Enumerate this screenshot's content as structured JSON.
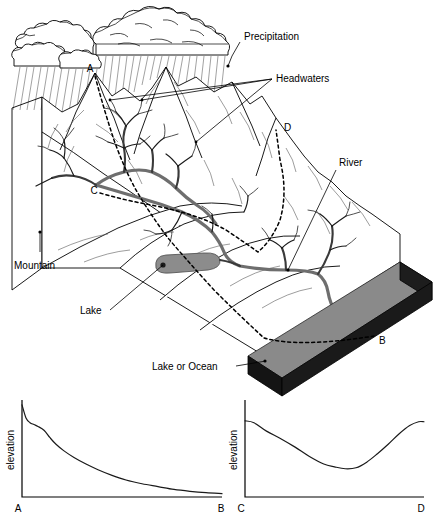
{
  "labels": {
    "precipitation": "Precipitation",
    "headwaters": "Headwaters",
    "river": "River",
    "mountain": "Mountain",
    "lake": "Lake",
    "lake_or_ocean": "Lake or Ocean"
  },
  "points": {
    "a": "A",
    "b": "B",
    "c": "C",
    "d": "D"
  },
  "colors": {
    "ocean_top": "#8a8a8a",
    "ocean_side": "#141414",
    "ocean_front": "#1d1d1d",
    "lake_fill": "#8c8c8c",
    "river": "#6e6e6e",
    "outline": "#000000",
    "contour": "#5a5a5a"
  },
  "chart_data": [
    {
      "type": "line",
      "title": "Longitudinal river profile A to B",
      "xlabel": "",
      "ylabel": "elevation",
      "x_tick_labels": [
        "A",
        "B"
      ],
      "grid": false,
      "legend": "none",
      "axis_ranges": {
        "x": [
          0,
          1
        ],
        "y": [
          0,
          1
        ]
      },
      "x": [
        0.0,
        0.02,
        0.04,
        0.06,
        0.08,
        0.11,
        0.14,
        0.17,
        0.21,
        0.26,
        0.32,
        0.38,
        0.45,
        0.52,
        0.6,
        0.68,
        0.76,
        0.84,
        0.92,
        1.0
      ],
      "y": [
        0.97,
        0.83,
        0.78,
        0.76,
        0.74,
        0.7,
        0.62,
        0.55,
        0.48,
        0.41,
        0.34,
        0.28,
        0.22,
        0.17,
        0.13,
        0.1,
        0.07,
        0.05,
        0.035,
        0.025
      ]
    },
    {
      "type": "line",
      "title": "Cross-valley elevation profile C to D",
      "xlabel": "",
      "ylabel": "elevation",
      "x_tick_labels": [
        "C",
        "D"
      ],
      "grid": false,
      "legend": "none",
      "axis_ranges": {
        "x": [
          0,
          1
        ],
        "y": [
          0,
          1
        ]
      },
      "x": [
        0.0,
        0.05,
        0.12,
        0.2,
        0.28,
        0.36,
        0.44,
        0.5,
        0.56,
        0.62,
        0.68,
        0.74,
        0.8,
        0.86,
        0.92,
        0.97,
        1.0
      ],
      "y": [
        0.8,
        0.78,
        0.69,
        0.61,
        0.52,
        0.42,
        0.34,
        0.31,
        0.29,
        0.3,
        0.36,
        0.45,
        0.55,
        0.66,
        0.75,
        0.79,
        0.79
      ]
    }
  ]
}
